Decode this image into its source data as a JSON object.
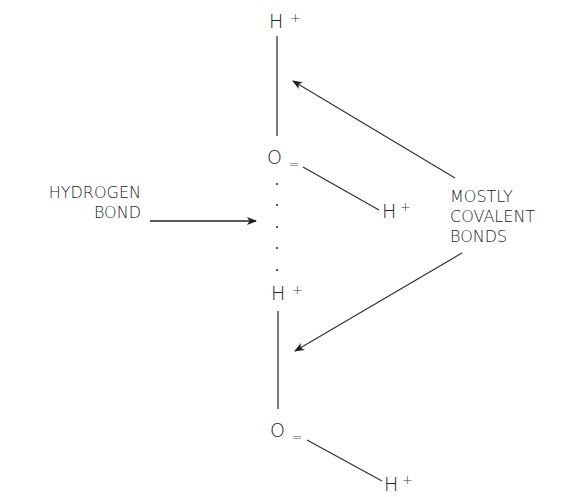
{
  "diagram": {
    "molecule_top": {
      "h_top": {
        "symbol": "H",
        "charge": "+"
      },
      "oxygen": {
        "symbol": "O",
        "charge": "="
      },
      "h_side": {
        "symbol": "H",
        "charge": "+"
      }
    },
    "molecule_bottom": {
      "h_top": {
        "symbol": "H",
        "charge": "+"
      },
      "oxygen": {
        "symbol": "O",
        "charge": "="
      },
      "h_side": {
        "symbol": "H",
        "charge": "+"
      }
    },
    "labels": {
      "hydrogen_bond": [
        "HYDROGEN",
        "BOND"
      ],
      "covalent": [
        "MOSTLY",
        "COVALENT",
        "BONDS"
      ]
    },
    "colors": {
      "line": "#333333",
      "text": "#222222",
      "faint_charge": "#999999",
      "background": "#ffffff"
    }
  }
}
